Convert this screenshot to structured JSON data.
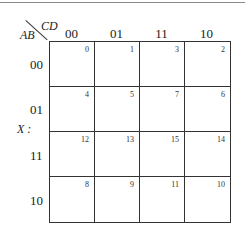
{
  "map": {
    "function_label": "X :",
    "col_var": "CD",
    "row_var": "AB",
    "col_headers": [
      "00",
      "01",
      "11",
      "10"
    ],
    "row_headers": [
      "00",
      "01",
      "11",
      "10"
    ],
    "cells": [
      [
        "0",
        "1",
        "3",
        "2"
      ],
      [
        "4",
        "5",
        "7",
        "6"
      ],
      [
        "12",
        "13",
        "15",
        "14"
      ],
      [
        "8",
        "9",
        "11",
        "10"
      ]
    ]
  }
}
